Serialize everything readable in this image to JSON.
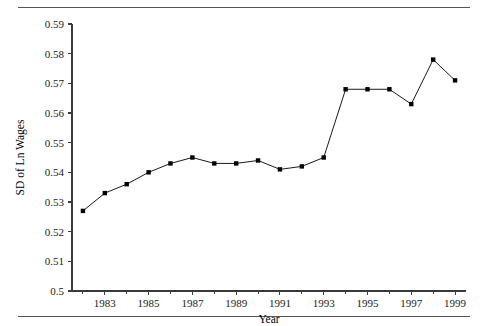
{
  "chart_data": {
    "type": "line",
    "title": "",
    "xlabel": "Year",
    "ylabel": "SD of Ln Wages",
    "xlim": [
      1981.5,
      1999.5
    ],
    "ylim": [
      0.5,
      0.59
    ],
    "grid": false,
    "legend": null,
    "x_ticks_major": [
      1983,
      1985,
      1987,
      1989,
      1991,
      1993,
      1995,
      1997,
      1999
    ],
    "x_tick_labels": [
      "1983",
      "1985",
      "1987",
      "1989",
      "1991",
      "1993",
      "1995",
      "1997",
      "1999"
    ],
    "x_ticks_minor": [
      1982,
      1984,
      1986,
      1988,
      1990,
      1992,
      1994,
      1996,
      1998
    ],
    "y_ticks": [
      0.5,
      0.51,
      0.52,
      0.53,
      0.54,
      0.55,
      0.56,
      0.57,
      0.58,
      0.59
    ],
    "y_tick_labels": [
      "0.5",
      "0.51",
      "0.52",
      "0.53",
      "0.54",
      "0.55",
      "0.56",
      "0.57",
      "0.58",
      "0.59"
    ],
    "marker": "square",
    "marker_color": "#000000",
    "line_color": "#000000",
    "x": [
      1982,
      1983,
      1984,
      1985,
      1986,
      1987,
      1988,
      1989,
      1990,
      1991,
      1992,
      1993,
      1994,
      1995,
      1996,
      1997,
      1998,
      1999
    ],
    "values": [
      0.527,
      0.533,
      0.536,
      0.54,
      0.543,
      0.545,
      0.543,
      0.543,
      0.544,
      0.541,
      0.542,
      0.545,
      0.568,
      0.568,
      0.568,
      0.563,
      0.578,
      0.571
    ],
    "categories": [
      "1982",
      "1983",
      "1984",
      "1985",
      "1986",
      "1987",
      "1988",
      "1989",
      "1990",
      "1991",
      "1992",
      "1993",
      "1994",
      "1995",
      "1996",
      "1997",
      "1998",
      "1999"
    ]
  }
}
